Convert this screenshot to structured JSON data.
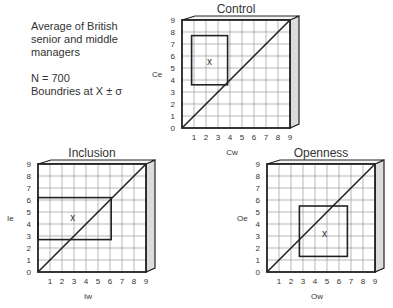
{
  "note": {
    "line1": "Average of British",
    "line2": "senior and middle",
    "line3": "managers",
    "n": "N = 700",
    "bounds": "Boundries at X ± σ"
  },
  "chart_data": [
    {
      "type": "scatter",
      "title": "Control",
      "xlabel": "Cw",
      "ylabel": "Ce",
      "xlim": [
        0,
        9
      ],
      "ylim": [
        0,
        9
      ],
      "grid": true,
      "x_ticks": [
        "1",
        "2",
        "3",
        "4",
        "5",
        "6",
        "7",
        "8",
        "9"
      ],
      "y_ticks": [
        "0",
        "1",
        "2",
        "3",
        "4",
        "5",
        "6",
        "7",
        "8",
        "9"
      ],
      "diagonal": [
        [
          0,
          0
        ],
        [
          9,
          9
        ]
      ],
      "mean_marker": {
        "label": "x",
        "x": 2.3,
        "y": 5.5
      },
      "box": {
        "x0": 0.8,
        "x1": 3.8,
        "y0": 3.6,
        "y1": 7.7
      }
    },
    {
      "type": "scatter",
      "title": "Inclusion",
      "xlabel": "Iw",
      "ylabel": "Ie",
      "xlim": [
        0,
        9
      ],
      "ylim": [
        0,
        9
      ],
      "grid": true,
      "x_ticks": [
        "1",
        "2",
        "3",
        "4",
        "5",
        "6",
        "7",
        "8",
        "9"
      ],
      "y_ticks": [
        "0",
        "1",
        "2",
        "3",
        "4",
        "5",
        "6",
        "7",
        "8",
        "9"
      ],
      "diagonal": [
        [
          0,
          0
        ],
        [
          9,
          9
        ]
      ],
      "mean_marker": {
        "label": "x",
        "x": 2.9,
        "y": 4.5
      },
      "box": {
        "x0": 0.0,
        "x1": 6.1,
        "y0": 2.7,
        "y1": 6.2
      }
    },
    {
      "type": "scatter",
      "title": "Openness",
      "xlabel": "Ow",
      "ylabel": "Oe",
      "xlim": [
        0,
        9
      ],
      "ylim": [
        0,
        9
      ],
      "grid": true,
      "x_ticks": [
        "1",
        "2",
        "3",
        "4",
        "5",
        "6",
        "7",
        "8",
        "9"
      ],
      "y_ticks": [
        "0",
        "1",
        "2",
        "3",
        "4",
        "5",
        "6",
        "7",
        "8",
        "9"
      ],
      "diagonal": [
        [
          0,
          0
        ],
        [
          9,
          9
        ]
      ],
      "mean_marker": {
        "label": "x",
        "x": 4.8,
        "y": 3.2
      },
      "box": {
        "x0": 2.7,
        "x1": 6.7,
        "y0": 1.3,
        "y1": 5.5
      }
    }
  ]
}
